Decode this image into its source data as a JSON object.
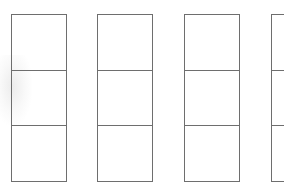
{
  "diagram": {
    "background": "#ffffff",
    "line_color": "#6e6e6e",
    "columns": [
      {
        "id": "column-1",
        "left": 11,
        "cells": 3
      },
      {
        "id": "column-2",
        "left": 97,
        "cells": 3
      },
      {
        "id": "column-3",
        "left": 184,
        "cells": 3
      },
      {
        "id": "column-4",
        "left": 271,
        "cells": 3,
        "clipped": true
      }
    ],
    "cell_count_per_column": 3,
    "column_count": 4
  }
}
